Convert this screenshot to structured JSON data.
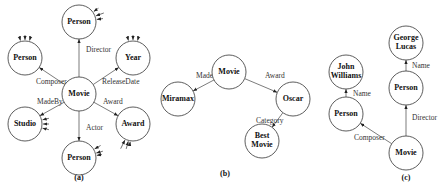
{
  "panels": [
    {
      "caption": "(a)",
      "nodes": [
        {
          "id": "movie",
          "label": "Movie"
        },
        {
          "id": "person_top",
          "label": "Person"
        },
        {
          "id": "person_left",
          "label": "Person"
        },
        {
          "id": "year",
          "label": "Year"
        },
        {
          "id": "studio",
          "label": "Studio"
        },
        {
          "id": "award",
          "label": "Award"
        },
        {
          "id": "person_bottom",
          "label": "Person"
        }
      ],
      "edges": [
        {
          "from": "movie",
          "to": "person_top",
          "label": "Director"
        },
        {
          "from": "movie",
          "to": "person_left",
          "label": "Composer"
        },
        {
          "from": "movie",
          "to": "year",
          "label": "ReleaseDate"
        },
        {
          "from": "movie",
          "to": "studio",
          "label": "MadeBy"
        },
        {
          "from": "movie",
          "to": "award",
          "label": "Award"
        },
        {
          "from": "movie",
          "to": "person_bottom",
          "label": "Actor"
        }
      ]
    },
    {
      "caption": "(b)",
      "nodes": [
        {
          "id": "movie",
          "label": "Movie"
        },
        {
          "id": "miramax",
          "label": "Miramax"
        },
        {
          "id": "oscar",
          "label": "Oscar"
        },
        {
          "id": "bestmovie",
          "label": "Best Movie",
          "lines": [
            "Best",
            "Movie"
          ]
        }
      ],
      "edges": [
        {
          "from": "movie",
          "to": "miramax",
          "label": "MadeBy"
        },
        {
          "from": "movie",
          "to": "oscar",
          "label": "Award"
        },
        {
          "from": "oscar",
          "to": "bestmovie",
          "label": "Category"
        }
      ]
    },
    {
      "caption": "(c)",
      "nodes": [
        {
          "id": "movie",
          "label": "Movie"
        },
        {
          "id": "person_l",
          "label": "Person"
        },
        {
          "id": "person_r",
          "label": "Person"
        },
        {
          "id": "john",
          "label": "John Williams",
          "lines": [
            "John",
            "Williams"
          ]
        },
        {
          "id": "george",
          "label": "George Lucas",
          "lines": [
            "George",
            "Lucas"
          ]
        }
      ],
      "edges": [
        {
          "from": "movie",
          "to": "person_l",
          "label": "Composer"
        },
        {
          "from": "movie",
          "to": "person_r",
          "label": "Director"
        },
        {
          "from": "person_l",
          "to": "john",
          "label": "Name"
        },
        {
          "from": "person_r",
          "to": "george",
          "label": "Name"
        }
      ]
    }
  ]
}
